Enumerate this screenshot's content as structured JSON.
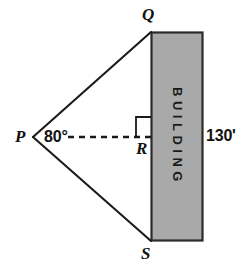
{
  "figure": {
    "type": "geometry-diagram",
    "background_color": "#ffffff",
    "stroke_color": "#1a1a1a",
    "building_fill_color": "#a9a9a9",
    "building_border_color": "#2b2b2b",
    "vertices": {
      "P": {
        "label": "P",
        "x": 33,
        "y": 137
      },
      "Q": {
        "label": "Q",
        "x": 151,
        "y": 32
      },
      "R": {
        "label": "R",
        "x": 151,
        "y": 137
      },
      "S": {
        "label": "S",
        "x": 151,
        "y": 241
      }
    },
    "angle": {
      "name": "angle-at-P",
      "label": "80°",
      "value": 80,
      "unit": "degrees",
      "at_vertex": "P"
    },
    "distance": {
      "name": "building-height",
      "label": "130'",
      "value": 130,
      "unit": "feet",
      "side": "QS"
    },
    "building": {
      "label": "BUILDING",
      "orientation": "vertical",
      "rect": {
        "x": 151,
        "y": 32,
        "width": 52,
        "height": 209
      }
    },
    "segments": [
      {
        "name": "segment-PQ",
        "from": "P",
        "to": "Q",
        "style": "solid"
      },
      {
        "name": "segment-PS",
        "from": "P",
        "to": "S",
        "style": "solid"
      },
      {
        "name": "segment-PR",
        "from": "P",
        "to": "R",
        "style": "dashed"
      },
      {
        "name": "segment-QS",
        "from": "Q",
        "to": "S",
        "style": "solid"
      }
    ],
    "right_angle_marker": {
      "name": "right-angle-at-R",
      "at_vertex": "R",
      "size": 15
    }
  }
}
